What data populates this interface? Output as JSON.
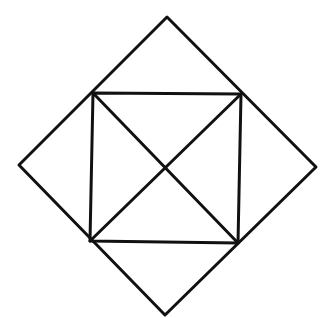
{
  "diagram": {
    "background": "#ffffff",
    "stroke_color": "#111111",
    "stroke_width": 3,
    "outer_diamond": {
      "points": [
        [
          167,
          17
        ],
        [
          316,
          167
        ],
        [
          165,
          315
        ],
        [
          19,
          165
        ]
      ]
    },
    "inner_square": {
      "points": [
        [
          93,
          93
        ],
        [
          241,
          94
        ],
        [
          238,
          243
        ],
        [
          90,
          241
        ]
      ]
    },
    "diagonals": [
      {
        "from": [
          93,
          93
        ],
        "to": [
          238,
          243
        ]
      },
      {
        "from": [
          241,
          94
        ],
        "to": [
          90,
          241
        ]
      }
    ]
  }
}
